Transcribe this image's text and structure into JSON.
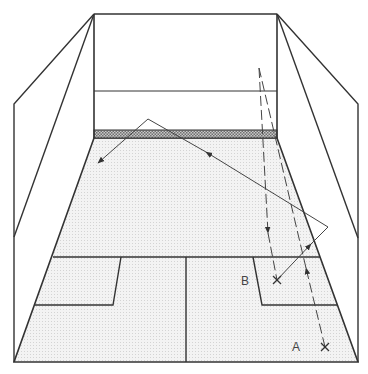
{
  "diagram": {
    "type": "squash-court-perspective",
    "labels": {
      "a": "A",
      "b": "B"
    },
    "colors": {
      "line": "#333333",
      "floor": "#ececec",
      "tin": "#9a9a9a",
      "background": "#ffffff"
    },
    "markers": [
      {
        "name": "position-a",
        "label": "A",
        "x": 325,
        "y": 347
      },
      {
        "name": "position-b",
        "label": "B",
        "x": 277,
        "y": 280
      }
    ]
  }
}
